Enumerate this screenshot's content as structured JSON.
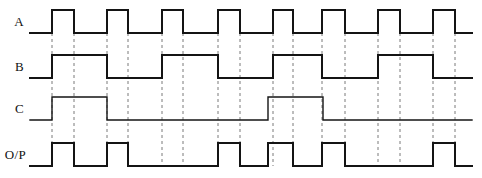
{
  "figure": {
    "type": "timing-diagram",
    "title": "",
    "background_color": "#ffffff",
    "wave_color": "#141414",
    "grid_color": "#7a7a7a",
    "width": 482,
    "height": 178
  },
  "axis": {
    "x_start": 30,
    "x_end": 472,
    "time_unit_px": 11,
    "grid_x_positions": [
      52,
      74,
      107,
      128,
      162,
      183,
      218,
      240,
      273,
      293,
      322,
      345,
      378,
      400,
      433,
      455
    ]
  },
  "signals": [
    {
      "name": "A",
      "label": "A",
      "row_index": 0,
      "y_high": 10,
      "y_low": 33,
      "edges": [
        {
          "x": 52,
          "level": "high"
        },
        {
          "x": 74,
          "level": "low"
        },
        {
          "x": 107,
          "level": "high"
        },
        {
          "x": 128,
          "level": "low"
        },
        {
          "x": 162,
          "level": "high"
        },
        {
          "x": 183,
          "level": "low"
        },
        {
          "x": 218,
          "level": "high"
        },
        {
          "x": 240,
          "level": "low"
        },
        {
          "x": 273,
          "level": "high"
        },
        {
          "x": 293,
          "level": "low"
        },
        {
          "x": 322,
          "level": "high"
        },
        {
          "x": 345,
          "level": "low"
        },
        {
          "x": 378,
          "level": "high"
        },
        {
          "x": 400,
          "level": "low"
        },
        {
          "x": 433,
          "level": "high"
        },
        {
          "x": 455,
          "level": "low"
        }
      ],
      "initial_level": "low",
      "path": "M30,33 L52,33 L52,10 L74,10 L74,33 L107,33 L107,10 L128,10 L128,33 L162,33 L162,10 L183,10 L183,33 L218,33 L218,10 L240,10 L240,33 L273,33 L273,10 L293,10 L293,33 L322,33 L322,10 L345,10 L345,33 L378,33 L378,10 L400,10 L400,33 L433,33 L433,10 L455,10 L455,33 L472,33"
    },
    {
      "name": "B",
      "label": "B",
      "row_index": 1,
      "y_high": 55,
      "y_low": 78,
      "edges": [
        {
          "x": 52,
          "level": "high"
        },
        {
          "x": 107,
          "level": "low"
        },
        {
          "x": 162,
          "level": "high"
        },
        {
          "x": 218,
          "level": "low"
        },
        {
          "x": 273,
          "level": "high"
        },
        {
          "x": 322,
          "level": "low"
        },
        {
          "x": 378,
          "level": "high"
        },
        {
          "x": 433,
          "level": "low"
        }
      ],
      "initial_level": "low",
      "path": "M30,78 L52,78 L52,55 L107,55 L107,78 L162,78 L162,55 L218,55 L218,78 L273,78 L273,55 L322,55 L322,78 L378,78 L378,55 L433,55 L433,78 L472,78"
    },
    {
      "name": "C",
      "label": "C",
      "row_index": 2,
      "y_high": 97,
      "y_low": 120,
      "edges": [
        {
          "x": 52,
          "level": "high"
        },
        {
          "x": 107,
          "level": "low"
        },
        {
          "x": 268,
          "level": "high"
        },
        {
          "x": 323,
          "level": "low"
        }
      ],
      "initial_level": "low",
      "path": "M30,120 L52,120 L52,97 L107,97 L107,120 L268,120 L268,97 L323,97 L323,120 L472,120"
    },
    {
      "name": "O/P",
      "label": "O/P",
      "row_index": 3,
      "y_high": 143,
      "y_low": 166,
      "edges": [
        {
          "x": 52,
          "level": "high"
        },
        {
          "x": 74,
          "level": "low"
        },
        {
          "x": 107,
          "level": "high"
        },
        {
          "x": 128,
          "level": "low"
        },
        {
          "x": 218,
          "level": "high"
        },
        {
          "x": 240,
          "level": "low"
        },
        {
          "x": 268,
          "level": "high"
        },
        {
          "x": 293,
          "level": "low"
        },
        {
          "x": 322,
          "level": "high"
        },
        {
          "x": 345,
          "level": "low"
        },
        {
          "x": 433,
          "level": "high"
        },
        {
          "x": 455,
          "level": "low"
        }
      ],
      "initial_level": "low",
      "path": "M30,166 L52,166 L52,143 L74,143 L74,166 L107,166 L107,143 L128,143 L128,166 L218,166 L218,143 L240,143 L240,166 L268,166 L268,143 L293,143 L293,166 L322,166 L322,143 L345,143 L345,166 L433,166 L433,143 L455,143 L455,166 L472,166"
    }
  ],
  "gridlines": [
    {
      "x": 52,
      "y_top": 33,
      "y_bottom": 166
    },
    {
      "x": 74,
      "y_top": 33,
      "y_bottom": 166
    },
    {
      "x": 107,
      "y_top": 33,
      "y_bottom": 166
    },
    {
      "x": 128,
      "y_top": 33,
      "y_bottom": 166
    },
    {
      "x": 162,
      "y_top": 33,
      "y_bottom": 166
    },
    {
      "x": 183,
      "y_top": 33,
      "y_bottom": 166
    },
    {
      "x": 218,
      "y_top": 33,
      "y_bottom": 166
    },
    {
      "x": 240,
      "y_top": 33,
      "y_bottom": 166
    },
    {
      "x": 273,
      "y_top": 33,
      "y_bottom": 166
    },
    {
      "x": 293,
      "y_top": 33,
      "y_bottom": 166
    },
    {
      "x": 322,
      "y_top": 33,
      "y_bottom": 166
    },
    {
      "x": 345,
      "y_top": 33,
      "y_bottom": 166
    },
    {
      "x": 378,
      "y_top": 33,
      "y_bottom": 166
    },
    {
      "x": 400,
      "y_top": 33,
      "y_bottom": 166
    },
    {
      "x": 433,
      "y_top": 33,
      "y_bottom": 166
    },
    {
      "x": 455,
      "y_top": 33,
      "y_bottom": 166
    }
  ],
  "labels": {
    "a": "A",
    "b": "B",
    "c": "C",
    "op": "O/P"
  },
  "label_positions": [
    {
      "key": "a",
      "x": 24,
      "y": 26,
      "anchor": "end"
    },
    {
      "key": "b",
      "x": 24,
      "y": 71,
      "anchor": "end"
    },
    {
      "key": "c",
      "x": 24,
      "y": 113,
      "anchor": "end"
    },
    {
      "key": "op",
      "x": 26,
      "y": 159,
      "anchor": "end"
    }
  ]
}
